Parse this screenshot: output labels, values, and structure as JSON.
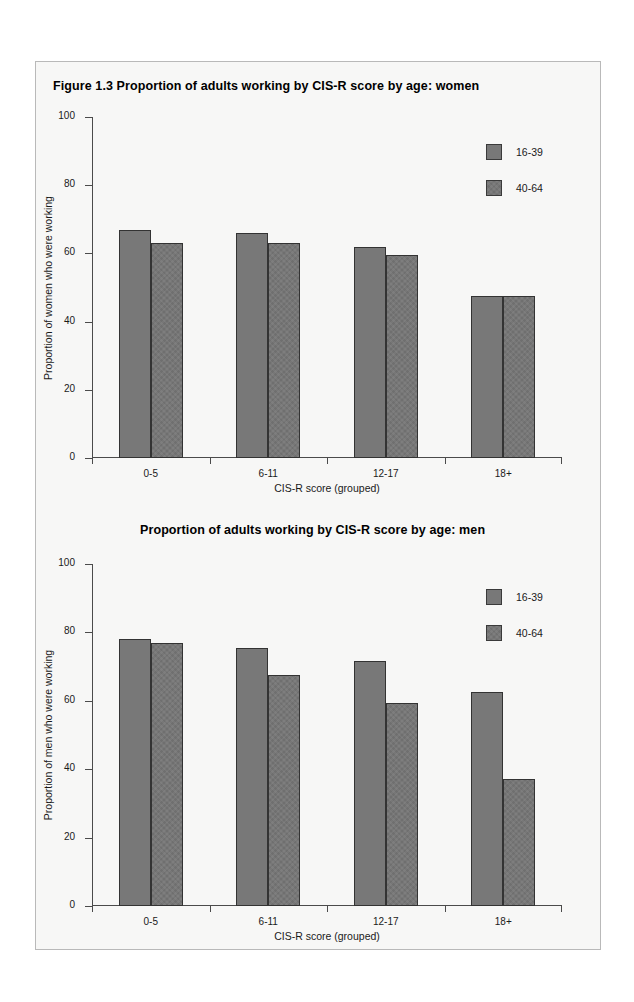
{
  "figure": {
    "panel_background": "#f7f7f6",
    "panel_border": "#b9b9b9"
  },
  "charts": [
    {
      "id": "women",
      "title": "Figure 1.3  Proportion of adults working by CIS-R score by age: women",
      "chart_data": {
        "type": "bar",
        "title": "Figure 1.3  Proportion of adults working by CIS-R score by age: women",
        "xlabel": "CIS-R score (grouped)",
        "ylabel": "Proportion of women who were working",
        "categories": [
          "0-5",
          "6-11",
          "12-17",
          "18+"
        ],
        "ylim": [
          0,
          100
        ],
        "yticks": [
          0,
          20,
          40,
          60,
          80,
          100
        ],
        "ytick_labels": [
          "0",
          "20",
          "40",
          "60",
          "80",
          "100"
        ],
        "grid": false,
        "legend_position": "top-right",
        "series": [
          {
            "name": "16-39",
            "color": "#787878",
            "values": [
              67,
              66,
              62,
              47.5
            ]
          },
          {
            "name": "40-64",
            "color": "#6f6f6f",
            "values": [
              63,
              63,
              59.5,
              47.5
            ]
          }
        ]
      }
    },
    {
      "id": "men",
      "title": "Proportion of adults working by CIS-R score by age: men",
      "chart_data": {
        "type": "bar",
        "title": "Proportion of adults working by CIS-R score by age: men",
        "xlabel": "CIS-R score (grouped)",
        "ylabel": "Proportion of men who were working",
        "categories": [
          "0-5",
          "6-11",
          "12-17",
          "18+"
        ],
        "ylim": [
          0,
          100
        ],
        "yticks": [
          0,
          20,
          40,
          60,
          80,
          100
        ],
        "ytick_labels": [
          "0",
          "20",
          "40",
          "60",
          "80",
          "100"
        ],
        "grid": false,
        "legend_position": "top-right",
        "series": [
          {
            "name": "16-39",
            "color": "#787878",
            "values": [
              78,
              75.5,
              71.5,
              62.5
            ]
          },
          {
            "name": "40-64",
            "color": "#6f6f6f",
            "values": [
              77,
              67.5,
              59.5,
              37
            ]
          }
        ]
      }
    }
  ]
}
